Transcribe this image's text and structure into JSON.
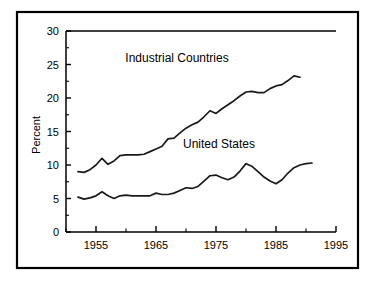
{
  "chart_data": {
    "type": "line",
    "title": "",
    "xlabel": "",
    "ylabel": "Percent",
    "xlim": [
      1950,
      1995
    ],
    "ylim": [
      0,
      30
    ],
    "grid": false,
    "legend_position": "inline-annotations",
    "x_ticks_major": [
      1955,
      1965,
      1975,
      1985,
      1995
    ],
    "x_ticks_major_labels": [
      "1955",
      "1965",
      "1975",
      "1985",
      "1995"
    ],
    "x_ticks_minor": [
      1950,
      1960,
      1970,
      1980,
      1990
    ],
    "y_ticks_major": [
      0,
      5,
      10,
      15,
      20,
      25,
      30
    ],
    "y_ticks_major_labels": [
      "0",
      "5",
      "10",
      "15",
      "20",
      "25",
      "30"
    ],
    "y_ticks_minor": [
      2.5,
      7.5,
      12.5,
      17.5,
      22.5,
      27.5
    ],
    "series": [
      {
        "name": "Industrial Countries",
        "label": "Industrial Countries",
        "label_x": 1968.5,
        "label_y": 25.4,
        "color": "#1a1a1a",
        "x": [
          1952,
          1953,
          1954,
          1955,
          1956,
          1957,
          1958,
          1959,
          1960,
          1961,
          1962,
          1963,
          1964,
          1965,
          1966,
          1967,
          1968,
          1969,
          1970,
          1971,
          1972,
          1973,
          1974,
          1975,
          1976,
          1977,
          1978,
          1979,
          1980,
          1981,
          1982,
          1983,
          1984,
          1985,
          1986,
          1987,
          1988,
          1989
        ],
        "values": [
          9.0,
          8.9,
          9.3,
          10.0,
          11.0,
          10.1,
          10.6,
          11.4,
          11.5,
          11.5,
          11.5,
          11.6,
          12.0,
          12.4,
          12.8,
          13.9,
          14.0,
          14.8,
          15.5,
          16.0,
          16.4,
          17.2,
          18.1,
          17.7,
          18.4,
          19.0,
          19.6,
          20.3,
          20.9,
          21.0,
          20.8,
          20.8,
          21.4,
          21.8,
          22.0,
          22.6,
          23.3,
          23.1
        ]
      },
      {
        "name": "United States",
        "label": "United States",
        "label_x": 1975.5,
        "label_y": 12.6,
        "color": "#1a1a1a",
        "x": [
          1952,
          1953,
          1954,
          1955,
          1956,
          1957,
          1958,
          1959,
          1960,
          1961,
          1962,
          1963,
          1964,
          1965,
          1966,
          1967,
          1968,
          1969,
          1970,
          1971,
          1972,
          1973,
          1974,
          1975,
          1976,
          1977,
          1978,
          1979,
          1980,
          1981,
          1982,
          1983,
          1984,
          1985,
          1986,
          1987,
          1988,
          1989,
          1990,
          1991
        ],
        "values": [
          5.2,
          4.9,
          5.1,
          5.4,
          6.0,
          5.4,
          5.0,
          5.4,
          5.5,
          5.4,
          5.4,
          5.4,
          5.4,
          5.8,
          5.6,
          5.6,
          5.8,
          6.2,
          6.6,
          6.5,
          6.8,
          7.6,
          8.4,
          8.5,
          8.1,
          7.8,
          8.2,
          9.1,
          10.2,
          9.8,
          9.0,
          8.2,
          7.6,
          7.2,
          7.8,
          8.8,
          9.6,
          10.0,
          10.2,
          10.3
        ]
      }
    ]
  },
  "figure": {
    "axis_title_y": "Percent",
    "background_color": "#ffffff",
    "line_color": "#1a1a1a",
    "border_color": "#000000"
  }
}
